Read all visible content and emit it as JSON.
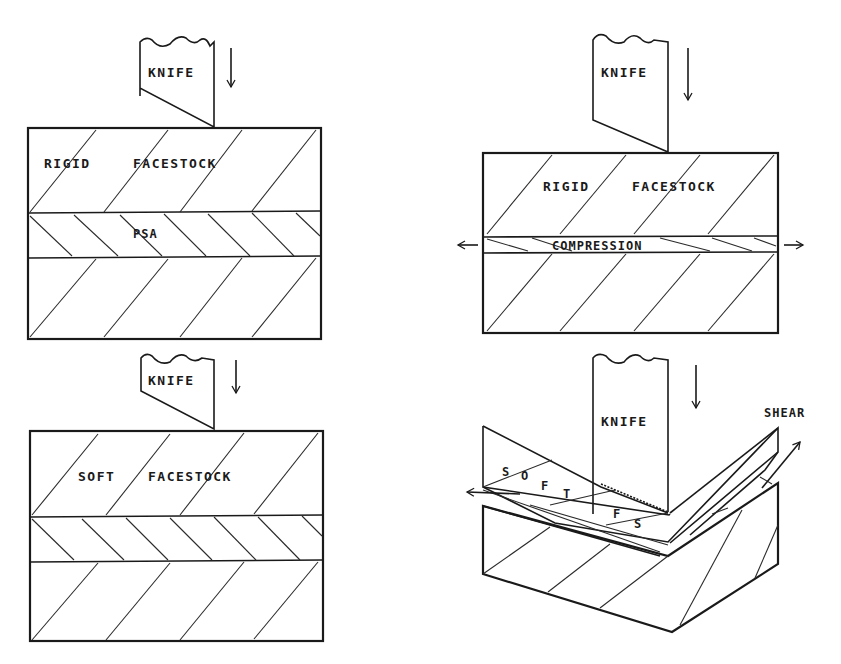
{
  "panels": {
    "top_left": {
      "knife_label": "KNIFE",
      "layer_label_1": "RIGID",
      "layer_label_2": "FACESTOCK",
      "adhesive_label": "PSA"
    },
    "top_right": {
      "knife_label": "KNIFE",
      "layer_label_1": "RIGID",
      "layer_label_2": "FACESTOCK",
      "adhesive_label": "COMPRESSION"
    },
    "bottom_left": {
      "knife_label": "KNIFE",
      "layer_label_1": "SOFT",
      "layer_label_2": "FACESTOCK"
    },
    "bottom_right": {
      "knife_label": "KNIFE",
      "force_label": "SHEAR",
      "letters": [
        "S",
        "O",
        "F",
        "T",
        "F",
        "S"
      ]
    }
  },
  "icons": {
    "down_arrow": "down-arrow-icon",
    "left_arrow": "left-arrow-icon",
    "right_arrow": "right-arrow-icon",
    "diagonal_arrow": "diagonal-arrow-icon"
  },
  "colors": {
    "line": "#1a1a1a",
    "background": "#ffffff"
  }
}
